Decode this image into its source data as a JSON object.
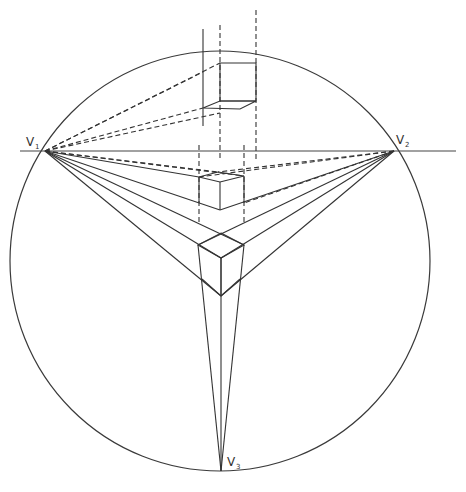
{
  "diagram": {
    "vanishing_points": [
      {
        "id": "V1",
        "letter": "V",
        "subscript": "1"
      },
      {
        "id": "V2",
        "letter": "V",
        "subscript": "2"
      },
      {
        "id": "V3",
        "letter": "V",
        "subscript": "3"
      }
    ],
    "elements": [
      "circle-of-vision",
      "horizon-line",
      "cube-top-projection",
      "cube-middle",
      "cube-bottom",
      "construction-lines"
    ],
    "colors": {
      "ink": "#333333",
      "background": "#ffffff"
    }
  }
}
